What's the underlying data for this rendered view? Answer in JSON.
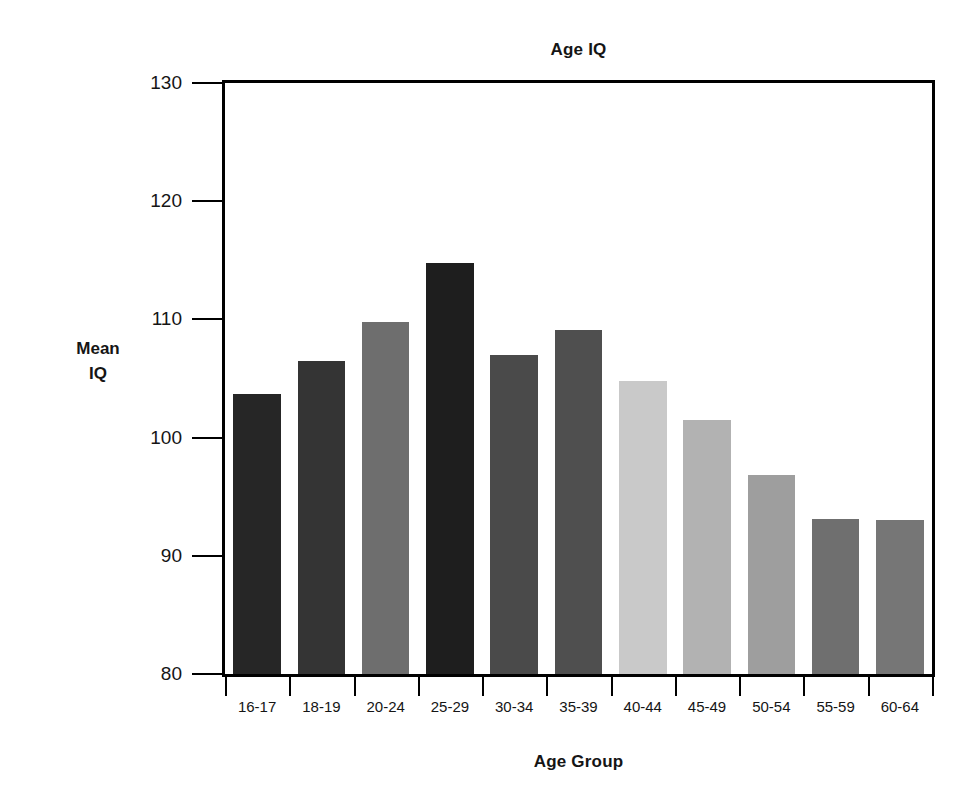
{
  "chart_data": {
    "type": "bar",
    "title": "Age IQ",
    "xlabel": "Age Group",
    "ylabel_line1": "Mean",
    "ylabel_line2": "IQ",
    "ylabel": "Mean IQ",
    "categories": [
      "16-17",
      "18-19",
      "20-24",
      "25-29",
      "30-34",
      "35-39",
      "40-44",
      "45-49",
      "50-54",
      "55-59",
      "60-64"
    ],
    "values": [
      103.7,
      106.5,
      109.8,
      114.8,
      107.0,
      109.1,
      104.8,
      101.5,
      96.8,
      93.1,
      93.0
    ],
    "bar_colors": [
      "#262626",
      "#343434",
      "#6e6e6e",
      "#1e1e1e",
      "#4a4a4a",
      "#4f4f4f",
      "#c9c9c9",
      "#b2b2b2",
      "#9e9e9e",
      "#6f6f6f",
      "#767676"
    ],
    "ylim": [
      80,
      130
    ],
    "yticks": [
      80,
      90,
      100,
      110,
      120,
      130
    ],
    "ytick_labels": [
      "80",
      "90",
      "100",
      "110",
      "120",
      "130"
    ],
    "grid": false,
    "legend": null,
    "axis_color": "#000000",
    "background": "#ffffff"
  }
}
